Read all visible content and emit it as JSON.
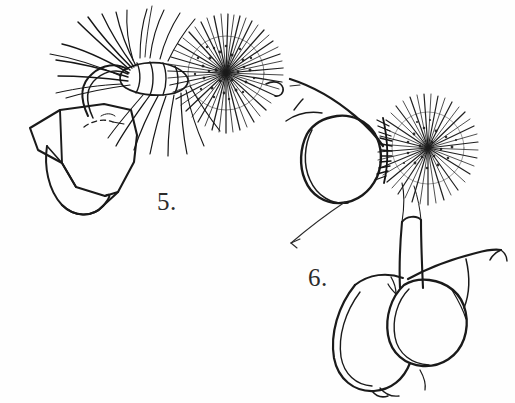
{
  "plate": {
    "title": "Insect antenna illustrations",
    "background_color": "#fefefe",
    "ink_color": "#1a1a1a",
    "width": 515,
    "height": 403,
    "style": "pen-and-ink line drawing"
  },
  "figures": [
    {
      "id": "figure-5",
      "label": "5.",
      "label_x": 157,
      "label_y": 188,
      "description": "Male plumose antenna with basal scape, pedicel and dense spherical flagellar tuft",
      "parts": [
        "scape",
        "pedicel",
        "flagellum",
        "plumose-hairs",
        "terminal-bush"
      ]
    },
    {
      "id": "figure-6",
      "label": "6.",
      "label_x": 308,
      "label_y": 264,
      "description": "Antenna with bushy flagellum attached to rounded head capsule and compound eye, lower palp segments below",
      "parts": [
        "head-capsule",
        "compound-eye",
        "antennal-base",
        "terminal-bush",
        "palp",
        "pointer-line"
      ]
    }
  ]
}
